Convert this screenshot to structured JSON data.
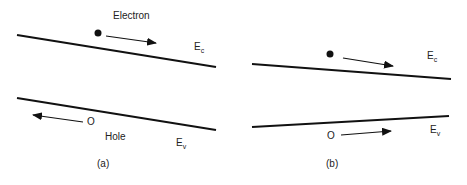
{
  "panel_a": {
    "caption": "(a)",
    "electron_label": "Electron",
    "hole_label": "Hole",
    "ec_label": "E",
    "ec_sub": "c",
    "ev_label": "E",
    "ev_sub": "v",
    "hole_symbol": "O"
  },
  "panel_b": {
    "caption": "(b)",
    "ec_label": "E",
    "ec_sub": "c",
    "ev_label": "E",
    "ev_sub": "v",
    "hole_symbol": "O"
  }
}
